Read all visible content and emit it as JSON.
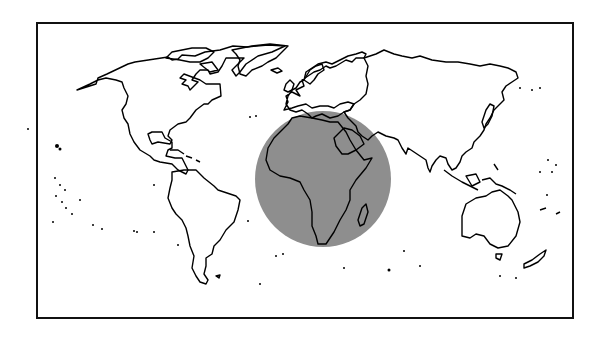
{
  "map": {
    "type": "world-outline-map",
    "projection": "equirectangular",
    "frame": {
      "x": 37,
      "y": 23,
      "width": 536,
      "height": 295,
      "stroke": "#111111"
    },
    "highlight": {
      "region": "Africa",
      "shape": "circle",
      "cx": 323,
      "cy": 179,
      "r": 68,
      "fill": "#8e8e8e"
    },
    "colors": {
      "background": "#ffffff",
      "coastline": "#000000",
      "highlight": "#8e8e8e"
    },
    "labels": []
  }
}
